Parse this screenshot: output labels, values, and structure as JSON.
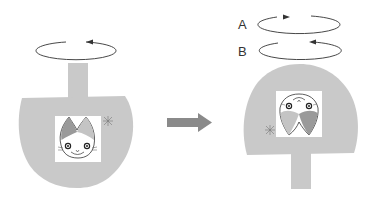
{
  "diagram": {
    "title": "",
    "labels": {
      "a": "A",
      "b": "B"
    },
    "colors": {
      "paddle": "#c9c9c9",
      "arrow": "#8a8a8a",
      "rotation": "#333333",
      "ear_dark": "#9a9a9a",
      "ear_light": "#c4c4c4"
    },
    "panels": [
      {
        "name": "before",
        "orientation": "stem-up",
        "rotation": "counterclockwise"
      },
      {
        "name": "after",
        "orientation": "stem-down",
        "rotations": [
          {
            "label": "A",
            "direction": "clockwise"
          },
          {
            "label": "B",
            "direction": "counterclockwise"
          }
        ]
      }
    ]
  }
}
